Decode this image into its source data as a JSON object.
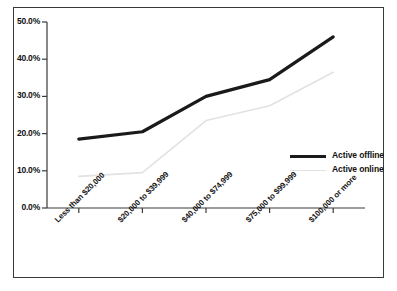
{
  "chart_data": {
    "type": "line",
    "title": "",
    "xlabel": "",
    "ylabel": "",
    "categories": [
      "Less than $20,000",
      "$20,000 to $39,999",
      "$40,000 to $74,999",
      "$75,000 to $99,999",
      "$100,000 or more"
    ],
    "series": [
      {
        "name": "Active offline",
        "color": "#1a1a1a",
        "values": [
          18.5,
          20.5,
          30.0,
          34.5,
          46.0
        ]
      },
      {
        "name": "Active online",
        "color": "#e2e2e2",
        "values": [
          8.5,
          9.5,
          23.5,
          27.5,
          36.5
        ]
      }
    ],
    "ylim": [
      0,
      50
    ],
    "yticks": [
      0,
      10,
      20,
      30,
      40,
      50
    ],
    "ytick_labels": [
      "0.0%",
      "10.0%",
      "20.0%",
      "30.0%",
      "40.0%",
      "50.0%"
    ],
    "grid": false,
    "legend_position": "inside-right"
  },
  "legend": {
    "entries": [
      {
        "label": "Active offline"
      },
      {
        "label": "Active online"
      }
    ]
  }
}
